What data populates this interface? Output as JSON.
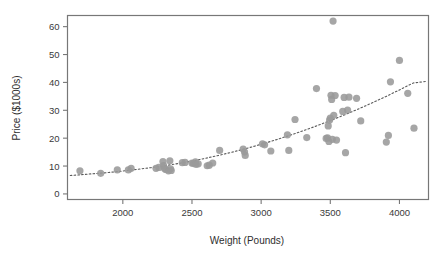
{
  "chart_data": {
    "type": "scatter",
    "title": "",
    "xlabel": "Weight (Pounds)",
    "ylabel": "Price ($1000s)",
    "xlim": [
      1600,
      4210
    ],
    "ylim": [
      -2,
      64
    ],
    "xticks": [
      2000,
      2500,
      3000,
      3500,
      4000
    ],
    "yticks": [
      0,
      10,
      20,
      30,
      40,
      50,
      60
    ],
    "xtick_labels": [
      "2000",
      "2500",
      "3000",
      "3500",
      "4000"
    ],
    "ytick_labels": [
      "0",
      "10",
      "20",
      "30",
      "40",
      "50",
      "60"
    ],
    "grid": false,
    "legend": false,
    "marker_color": "#9a9a9a",
    "marker_radius": 3.6,
    "frame_color": "#777777",
    "trend_style": "dotted",
    "trend_color": "#5a5a5a",
    "points": [
      [
        1690,
        8.3
      ],
      [
        1840,
        7.4
      ],
      [
        1960,
        8.6
      ],
      [
        2040,
        8.6
      ],
      [
        2060,
        9.2
      ],
      [
        2240,
        9.2
      ],
      [
        2260,
        9.5
      ],
      [
        2290,
        11.6
      ],
      [
        2295,
        10.2
      ],
      [
        2300,
        9.2
      ],
      [
        2310,
        8.8
      ],
      [
        2330,
        8.3
      ],
      [
        2340,
        11.9
      ],
      [
        2345,
        9.0
      ],
      [
        2350,
        8.4
      ],
      [
        2430,
        11.2
      ],
      [
        2450,
        11.3
      ],
      [
        2500,
        11.1
      ],
      [
        2510,
        10.9
      ],
      [
        2525,
        11.5
      ],
      [
        2530,
        10.6
      ],
      [
        2545,
        10.8
      ],
      [
        2610,
        10.1
      ],
      [
        2625,
        10.3
      ],
      [
        2650,
        11.1
      ],
      [
        2700,
        15.6
      ],
      [
        2870,
        16.1
      ],
      [
        2880,
        15.0
      ],
      [
        2885,
        13.8
      ],
      [
        3010,
        18.0
      ],
      [
        3025,
        17.6
      ],
      [
        3070,
        15.4
      ],
      [
        3190,
        21.2
      ],
      [
        3200,
        15.6
      ],
      [
        3245,
        26.7
      ],
      [
        3330,
        20.2
      ],
      [
        3400,
        37.8
      ],
      [
        3470,
        19.9
      ],
      [
        3480,
        20.1
      ],
      [
        3485,
        24.4
      ],
      [
        3490,
        18.8
      ],
      [
        3495,
        26.5
      ],
      [
        3500,
        27.2
      ],
      [
        3505,
        35.4
      ],
      [
        3510,
        33.9
      ],
      [
        3515,
        19.6
      ],
      [
        3520,
        62.0
      ],
      [
        3525,
        28.2
      ],
      [
        3535,
        35.3
      ],
      [
        3545,
        19.3
      ],
      [
        3590,
        29.6
      ],
      [
        3600,
        34.6
      ],
      [
        3610,
        14.8
      ],
      [
        3625,
        30.1
      ],
      [
        3635,
        34.7
      ],
      [
        3690,
        34.3
      ],
      [
        3720,
        26.2
      ],
      [
        3905,
        18.6
      ],
      [
        3920,
        21.0
      ],
      [
        3935,
        40.2
      ],
      [
        4000,
        47.9
      ],
      [
        4060,
        36.1
      ],
      [
        4105,
        23.6
      ]
    ],
    "trend_points": [
      [
        1620,
        6.6
      ],
      [
        1700,
        6.9
      ],
      [
        1800,
        7.3
      ],
      [
        1900,
        7.7
      ],
      [
        2000,
        8.2
      ],
      [
        2100,
        8.8
      ],
      [
        2200,
        9.4
      ],
      [
        2300,
        10.1
      ],
      [
        2400,
        10.9
      ],
      [
        2500,
        11.8
      ],
      [
        2600,
        12.8
      ],
      [
        2700,
        13.9
      ],
      [
        2800,
        15.1
      ],
      [
        2900,
        16.4
      ],
      [
        3000,
        17.8
      ],
      [
        3100,
        19.3
      ],
      [
        3200,
        20.9
      ],
      [
        3300,
        22.6
      ],
      [
        3400,
        24.4
      ],
      [
        3500,
        26.3
      ],
      [
        3600,
        28.3
      ],
      [
        3700,
        30.4
      ],
      [
        3800,
        32.6
      ],
      [
        3900,
        34.9
      ],
      [
        4000,
        37.3
      ],
      [
        4100,
        39.8
      ],
      [
        4200,
        40.4
      ]
    ]
  }
}
